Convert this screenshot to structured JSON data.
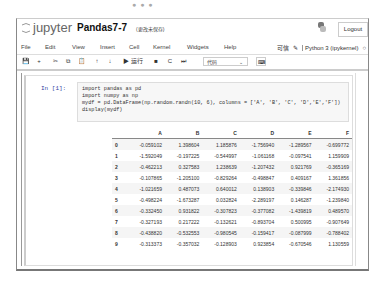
{
  "window": {
    "dots": "● ● ●"
  },
  "header": {
    "brand": "jupyter",
    "notebook_name": "Pandas7-7",
    "save_status": "(更改未保存)",
    "logout_label": "Logout"
  },
  "menubar": {
    "items": [
      "File",
      "Edit",
      "View",
      "Insert",
      "Cell",
      "Kernel",
      "Widgets",
      "Help"
    ],
    "trusted_label": "可信",
    "kernel_label": "Python 3 (ipykernel)"
  },
  "toolbar": {
    "save_icon": "💾",
    "add_icon": "+",
    "cut_icon": "✂",
    "copy_icon": "⧉",
    "paste_icon": "📋",
    "up_icon": "↑",
    "down_icon": "↓",
    "run_label": "▶ 运行",
    "stop_icon": "■",
    "restart_icon": "C",
    "fastforward_icon": "⏭",
    "cell_type": "代码",
    "keyboard_icon": "⌨"
  },
  "cell": {
    "prompt": "In [1]:",
    "code": [
      "import pandas as pd",
      "import numpy as np",
      "mydf = pd.DataFrame(np.random.randn(10, 6), columns = ['A', 'B', 'C', 'D','E','F'])",
      "display(mydf)"
    ]
  },
  "output": {
    "columns": [
      "",
      "A",
      "B",
      "C",
      "D",
      "E",
      "F"
    ],
    "rows": [
      [
        "0",
        "-0.059102",
        "1.398604",
        "1.185876",
        "-1.756940",
        "-1.289567",
        "-0.699772"
      ],
      [
        "1",
        "-1.592049",
        "-0.197225",
        "-0.544997",
        "-1.061168",
        "-0.097541",
        "1.159909"
      ],
      [
        "2",
        "-0.462213",
        "0.327583",
        "1.238639",
        "-1.207432",
        "0.921769",
        "-0.365169"
      ],
      [
        "3",
        "-0.107865",
        "-1.205100",
        "-0.829264",
        "-0.498847",
        "0.409167",
        "1.361856"
      ],
      [
        "4",
        "-1.021659",
        "0.487073",
        "0.640012",
        "0.138903",
        "-0.339846",
        "-2.174930"
      ],
      [
        "5",
        "-0.498224",
        "-1.673287",
        "0.032824",
        "-2.289197",
        "0.146287",
        "-1.239840"
      ],
      [
        "6",
        "-0.332450",
        "0.931822",
        "-0.307823",
        "-0.377082",
        "-1.439819",
        "0.489570"
      ],
      [
        "7",
        "-0.327193",
        "0.217222",
        "-0.132621",
        "-0.893704",
        "0.500995",
        "-0.907649"
      ],
      [
        "8",
        "-0.438820",
        "-0.532553",
        "-0.980545",
        "-0.159417",
        "-0.087999",
        "-0.788402"
      ],
      [
        "9",
        "-0.313373",
        "-0.357032",
        "-0.128903",
        "0.923854",
        "-0.670546",
        "1.130559"
      ]
    ]
  }
}
